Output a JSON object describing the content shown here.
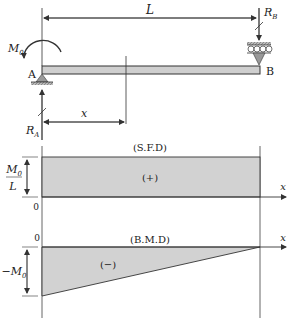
{
  "beam": {
    "label_L": "L",
    "label_x": "x",
    "label_A": "A",
    "label_B": "B",
    "moment_M": "M",
    "moment_sub": "0",
    "reaction_A": "R",
    "reaction_A_sub": "A",
    "reaction_B": "R",
    "reaction_B_sub": "B"
  },
  "sfd": {
    "title": "(S.F.D)",
    "sign": "(+)",
    "value_num_M": "M",
    "value_num_sub": "0",
    "value_den": "L",
    "zero": "0",
    "axis": "x"
  },
  "bmd": {
    "title": "(B.M.D)",
    "sign": "(−)",
    "value": "−M",
    "value_sub": "0",
    "zero": "0",
    "axis": "x"
  },
  "colors": {
    "fill": "#d2d2d2",
    "line": "#333333",
    "beam_fill": "#cfcfcf"
  }
}
